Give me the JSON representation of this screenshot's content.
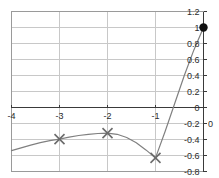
{
  "chart_data": {
    "type": "line",
    "title": "",
    "subtitle": "",
    "xlabel": "",
    "ylabel": "",
    "xlim": [
      -4,
      0
    ],
    "ylim": [
      -0.8,
      1.2
    ],
    "grid": true,
    "legend": null,
    "x_ticks": [
      -4,
      -3,
      -2,
      -1,
      0
    ],
    "x_tick_labels": [
      "-4",
      "-3",
      "-2",
      "-1",
      "0"
    ],
    "y_ticks": [
      1.2,
      1,
      0.8,
      0.6,
      0.4,
      0.2,
      0,
      -0.2,
      -0.4,
      -0.6,
      -0.8
    ],
    "y_tick_labels": [
      "1.2",
      "1",
      "0.8",
      "0.6",
      "0.4",
      "0.2",
      "0",
      "-0.2",
      "-0.4",
      "-0.6",
      "-0.8"
    ],
    "series": [
      {
        "name": "curve",
        "color": "#808080",
        "x": [
          -4.0,
          -3.8,
          -3.6,
          -3.4,
          -3.2,
          -3.0,
          -2.8,
          -2.6,
          -2.4,
          -2.2,
          -2.0,
          -1.8,
          -1.6,
          -1.4,
          -1.2,
          -1.0,
          -0.8,
          -0.6,
          -0.4,
          -0.2,
          0.0
        ],
        "y": [
          -0.54,
          -0.505,
          -0.47,
          -0.44,
          -0.415,
          -0.395,
          -0.37,
          -0.35,
          -0.335,
          -0.325,
          -0.32,
          -0.335,
          -0.375,
          -0.44,
          -0.53,
          -0.63,
          -0.3,
          0.05,
          0.4,
          0.72,
          1.0
        ]
      }
    ],
    "markers": [
      {
        "shape": "x",
        "x": -3,
        "y": -0.395,
        "color": "#6b6b6b",
        "label": ""
      },
      {
        "shape": "x",
        "x": -2,
        "y": -0.32,
        "color": "#6b6b6b",
        "label": ""
      },
      {
        "shape": "x",
        "x": -1,
        "y": -0.63,
        "color": "#6b6b6b",
        "label": ""
      },
      {
        "shape": "dot",
        "x": 0,
        "y": 1.0,
        "color": "#111111",
        "label": ""
      }
    ],
    "axis_colors": {
      "grid": "#c8c8c8",
      "frame": "#9a9a9a",
      "zero_line": "#3a3a3a",
      "y_axis": "#3a3a3a",
      "tick_text": "#2b2b2b"
    }
  }
}
